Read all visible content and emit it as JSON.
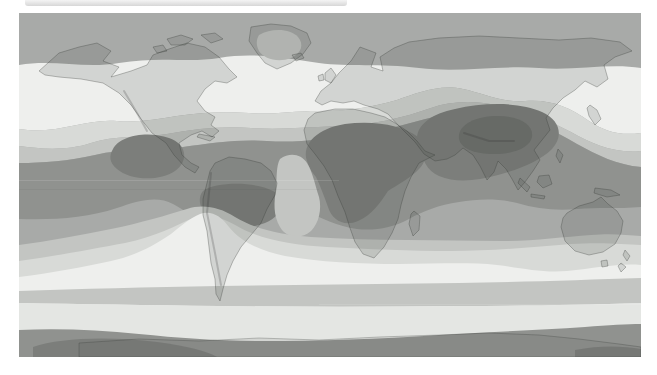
{
  "meta": {
    "map_type": "world-contour-map",
    "projection": "equirectangular"
  },
  "window": {
    "top_strip": {
      "present": true,
      "note": "partial light-gray bar clipped at top of screenshot"
    }
  },
  "theme": {
    "page_bg": "#ffffff",
    "band_base": "#a8aaa8",
    "band_white": "#eeefed",
    "band_l1": "#d8dad7",
    "band_l2": "#c3c5c2",
    "band_l4": "#90928f",
    "band_l5": "#7c7e7b",
    "band_l6": "#6e706d",
    "band_light_south": "#e4e6e3",
    "ice_cap": "#c6c8c5",
    "land_fill": "rgba(70,72,70,0.16)",
    "land_stroke": "rgba(55,57,55,0.40)",
    "ant_coast_fill": "rgba(70,72,70,0.10)",
    "relief_stroke": "rgba(50,52,50,0.22)",
    "topbar_from": "#f4f4f4",
    "topbar_to": "#d7d7d7"
  },
  "map": {
    "shade_levels": [
      {
        "name": "lightest",
        "hex": "#eeefed"
      },
      {
        "name": "light",
        "hex": "#d8dad7"
      },
      {
        "name": "medium-light",
        "hex": "#c3c5c2"
      },
      {
        "name": "medium",
        "hex": "#a8aaa8"
      },
      {
        "name": "medium-dark",
        "hex": "#90928f"
      },
      {
        "name": "dark",
        "hex": "#7c7e7b"
      },
      {
        "name": "darkest",
        "hex": "#6e706d"
      }
    ],
    "bands_north_to_south": [
      "polar-medium-gray",
      "north-midlatitude-white",
      "north-light-gray",
      "north-medium-light",
      "north-subtropical-medium-dark",
      "subtropical-dark-cores (Mexico, northern South America, Sahara-Arabia, South Asia with darkest Tibet core, southern Africa)",
      "tropical-medium",
      "south-medium-light",
      "south-light",
      "south-midlatitude-white",
      "subantarctic-gray-stripe",
      "subantarctic-light",
      "antarctic-medium-dark with darker patches"
    ],
    "landmasses": [
      "north-america",
      "greenland",
      "south-america",
      "africa",
      "eurasia",
      "australia",
      "tasmania",
      "united-kingdom",
      "ireland",
      "iceland",
      "japan",
      "philippines",
      "borneo",
      "sumatra",
      "java",
      "new-guinea",
      "madagascar",
      "new-zealand",
      "cuba",
      "arctic-islands",
      "antarctica-coast"
    ]
  }
}
